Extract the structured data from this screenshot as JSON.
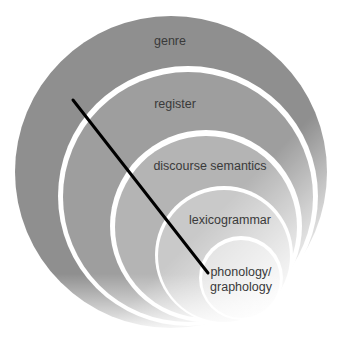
{
  "diagram": {
    "type": "nested-circles",
    "layers": [
      {
        "label": "genre",
        "fill": "#8f8f8f"
      },
      {
        "label": "register",
        "fill": "#9e9e9e"
      },
      {
        "label": "discourse semantics",
        "fill": "#b4b4b4"
      },
      {
        "label": "lexicogrammar",
        "fill": "#c9c9c9"
      },
      {
        "label": "phonology/\ngraphology",
        "line1": "phonology/",
        "line2": "graphology",
        "fill": "#dedede"
      }
    ],
    "connector": {
      "from": [
        73,
        100
      ],
      "to": [
        208,
        273
      ],
      "color": "#000000"
    }
  }
}
